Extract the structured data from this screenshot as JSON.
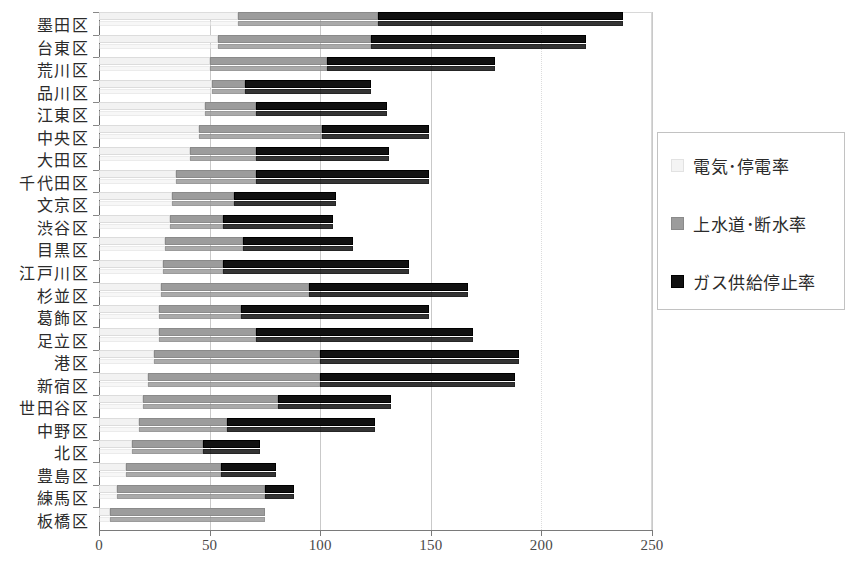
{
  "chart_data": {
    "type": "bar",
    "orientation": "horizontal",
    "stacked": true,
    "title": "",
    "xlabel": "",
    "ylabel": "",
    "xlim": [
      0,
      250
    ],
    "xticks": [
      0,
      50,
      100,
      150,
      200,
      250
    ],
    "grid": true,
    "legend_position": "right",
    "categories": [
      "墨田区",
      "台東区",
      "荒川区",
      "品川区",
      "江東区",
      "中央区",
      "大田区",
      "千代田区",
      "文京区",
      "渋谷区",
      "目黒区",
      "江戸川区",
      "杉並区",
      "葛飾区",
      "足立区",
      "港区",
      "新宿区",
      "世田谷区",
      "中野区",
      "北区",
      "豊島区",
      "練馬区",
      "板橋区"
    ],
    "series": [
      {
        "name": "電気･停電率",
        "color": "#f2f2f2",
        "values": [
          63,
          54,
          50,
          51,
          48,
          45,
          41,
          35,
          33,
          32,
          30,
          29,
          28,
          27,
          27,
          25,
          22,
          20,
          18,
          15,
          12,
          8,
          5
        ]
      },
      {
        "name": "上水道･断水率",
        "color": "#9c9c9c",
        "values": [
          63,
          69,
          53,
          15,
          23,
          56,
          30,
          36,
          28,
          24,
          35,
          27,
          67,
          37,
          44,
          75,
          78,
          61,
          40,
          32,
          43,
          67,
          70
        ]
      },
      {
        "name": "ガス供給停止率",
        "color": "#111111",
        "values": [
          111,
          97,
          76,
          57,
          59,
          48,
          60,
          78,
          46,
          50,
          50,
          84,
          72,
          85,
          98,
          90,
          88,
          51,
          67,
          26,
          25,
          13,
          0
        ]
      }
    ],
    "totals": [
      237,
      220,
      179,
      123,
      130,
      149,
      131,
      149,
      107,
      106,
      115,
      140,
      167,
      149,
      169,
      190,
      188,
      132,
      125,
      73,
      80,
      88,
      75
    ]
  },
  "legend": {
    "items": [
      {
        "label": "電気･停電率",
        "swatch": "light-gray-swatch-icon"
      },
      {
        "label": "上水道･断水率",
        "swatch": "medium-gray-swatch-icon"
      },
      {
        "label": "ガス供給停止率",
        "swatch": "black-swatch-icon"
      }
    ]
  },
  "caption": ""
}
